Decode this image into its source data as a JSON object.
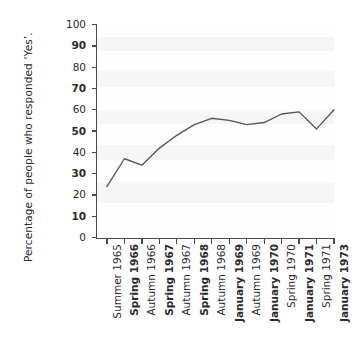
{
  "chart_data": {
    "type": "line",
    "title": "",
    "xlabel": "",
    "ylabel": "Percentage of people who responded ‘Yes’.",
    "ylim": [
      0,
      100
    ],
    "ytick_values": [
      0,
      10,
      20,
      30,
      40,
      50,
      60,
      70,
      80,
      90,
      100
    ],
    "ytick_labels": [
      "0",
      "10",
      "20",
      "30",
      "40",
      "50",
      "60",
      "70",
      "80",
      "90",
      "100"
    ],
    "ytick_bold": [
      false,
      true,
      false,
      true,
      false,
      true,
      false,
      true,
      false,
      true,
      false
    ],
    "grid": false,
    "legend": "none",
    "categories": [
      "Summer 1965",
      "Spring 1966",
      "Autumn 1966",
      "Spring 1967",
      "Autumn 1967",
      "Spring 1968",
      "Autumn 1968",
      "January 1969",
      "Autumn 1969",
      "January 1970",
      "Spring 1970",
      "January 1971",
      "Spring 1971",
      "January 1973"
    ],
    "category_bold": [
      false,
      true,
      false,
      true,
      false,
      true,
      false,
      true,
      false,
      true,
      false,
      true,
      false,
      true
    ],
    "values": [
      24,
      37,
      34,
      42,
      48,
      53,
      56,
      55,
      53,
      54,
      58,
      59,
      51,
      60
    ],
    "series_color": "#555555"
  }
}
